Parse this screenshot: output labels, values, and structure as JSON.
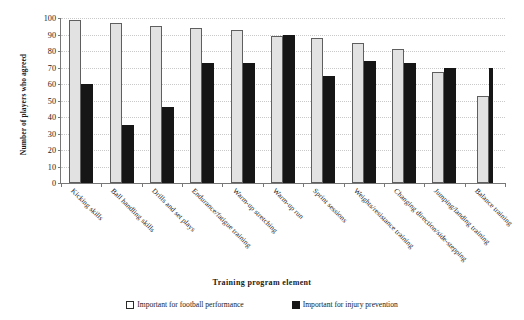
{
  "chart_data": {
    "type": "bar",
    "title": "",
    "xlabel": "Training program element",
    "ylabel": "Number of players who agreed",
    "ylim": [
      0,
      100
    ],
    "ytick_step": 10,
    "yticks": [
      "100",
      "90",
      "80",
      "70",
      "60",
      "50",
      "40",
      "30",
      "20",
      "10",
      "0"
    ],
    "grid": true,
    "legend_position": "bottom",
    "categories": [
      "Kicking skills",
      "Ball handling skills",
      "Drills and set plays",
      "Endurance/fatigue training",
      "Warm-up stretching",
      "Warm-up run",
      "Sprint sessions",
      "Weights/resistance training",
      "Changing direction/side-stepping",
      "Jumping/landing training",
      "Balance training"
    ],
    "series": [
      {
        "name": "Important for football performance",
        "color": "#e2e2e2",
        "values": [
          99,
          97,
          95,
          94,
          93,
          89,
          88,
          85,
          81,
          67,
          53
        ]
      },
      {
        "name": "Important for injury prevention",
        "color": "#161616",
        "values": [
          60,
          35,
          46,
          73,
          73,
          90,
          65,
          74,
          73,
          70,
          70
        ]
      }
    ]
  },
  "legend": {
    "items": [
      {
        "label": "Important for football performance",
        "swatch": "open-square-icon"
      },
      {
        "label": "Important for injury prevention",
        "swatch": "filled-square-icon"
      }
    ]
  }
}
